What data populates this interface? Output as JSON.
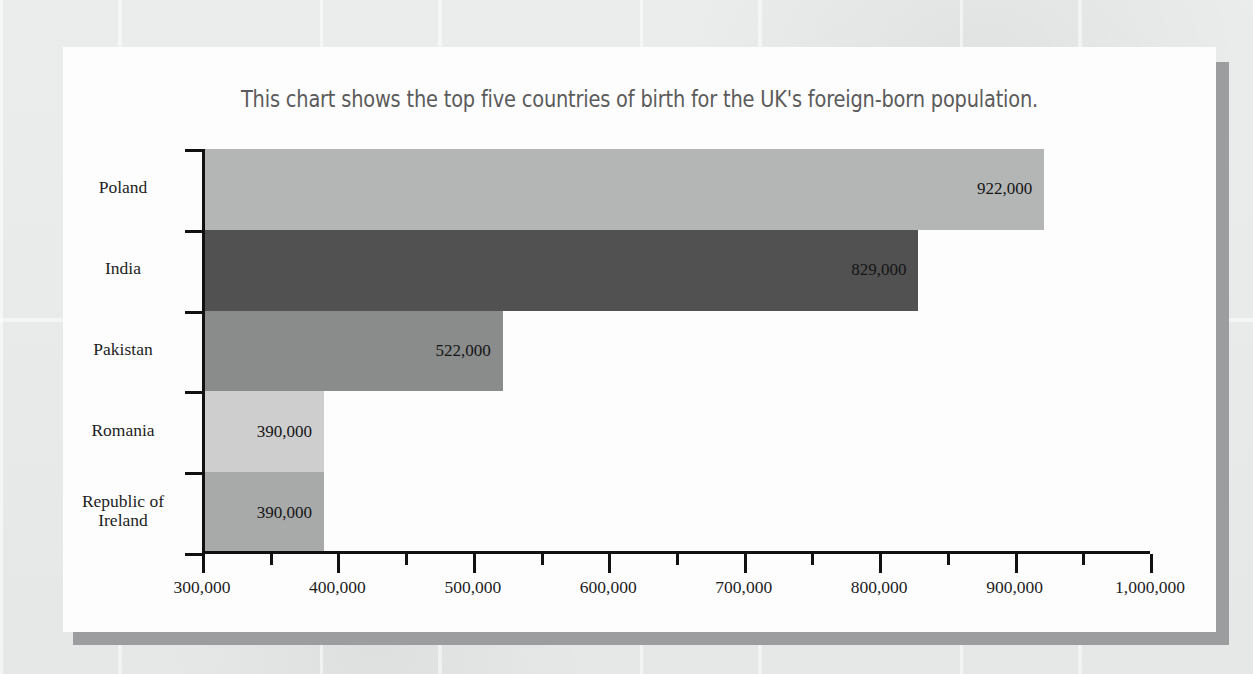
{
  "chart_data": {
    "type": "bar",
    "orientation": "horizontal",
    "title": "This chart shows the top five countries of birth for the UK's foreign-born population.",
    "xlabel": "",
    "ylabel": "",
    "categories": [
      "Poland",
      "India",
      "Pakistan",
      "Romania",
      "Republic of\nIreland"
    ],
    "values": [
      922000,
      829000,
      522000,
      390000,
      390000
    ],
    "value_labels": [
      "922,000",
      "829,000",
      "522,000",
      "390,000",
      "390,000"
    ],
    "bar_colors": [
      "#b4b5b5",
      "#515152",
      "#8a8b8b",
      "#cdcecd",
      "#a8a9a9"
    ],
    "xlim": [
      300000,
      1000000
    ],
    "xticks": [
      300000,
      400000,
      500000,
      600000,
      700000,
      800000,
      900000,
      1000000
    ],
    "xtick_labels": [
      "300,000",
      "400,000",
      "500,000",
      "600,000",
      "700,000",
      "800,000",
      "900,000",
      "1,000,000"
    ],
    "minor_ticks_between": 1,
    "grid": false,
    "legend": false
  },
  "card": {
    "background": "#fdfdfd",
    "shadow_color": "#9b9d9e"
  },
  "page": {
    "background": "#e9eaea"
  }
}
